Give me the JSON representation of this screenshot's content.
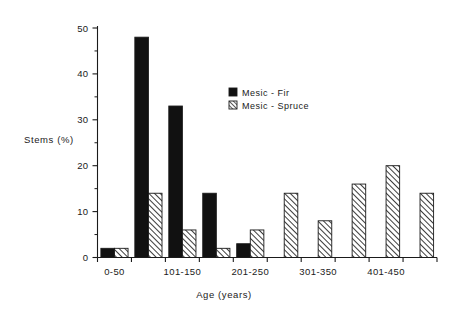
{
  "chart_data": {
    "type": "bar",
    "title": "",
    "xlabel": "Age (years)",
    "ylabel": "Stems (%)",
    "ylim": [
      0,
      50
    ],
    "y_ticks": [
      0,
      10,
      20,
      30,
      40,
      50
    ],
    "y_tick_labels": [
      "0",
      "10",
      "20",
      "30",
      "40",
      "50"
    ],
    "y_minor_ticks": [
      5,
      15,
      25,
      35,
      45
    ],
    "grid": false,
    "legend_position": "upper-center-right",
    "categories": [
      "0-50",
      "51-100",
      "101-150",
      "151-200",
      "201-250",
      "251-300",
      "301-350",
      "351-400",
      "401-450",
      "451-500"
    ],
    "x_tick_labels_shown": [
      "0-50",
      "101-150",
      "201-250",
      "301-350",
      "401-450"
    ],
    "x_label_category_index": [
      0,
      2,
      4,
      6,
      8
    ],
    "series": [
      {
        "name": "Mesic - Fir",
        "fill": "solid-black",
        "color": "#111111",
        "values": [
          2,
          48,
          33,
          14,
          3,
          0,
          0,
          0,
          0,
          0
        ]
      },
      {
        "name": "Mesic - Spruce",
        "fill": "diagonal-hatch",
        "color": "#ffffff",
        "values": [
          2,
          14,
          6,
          2,
          6,
          14,
          8,
          16,
          20,
          14
        ]
      }
    ]
  },
  "legend": {
    "items": [
      {
        "label": "Mesic - Fir",
        "swatch": "solid-black"
      },
      {
        "label": "Mesic - Spruce",
        "swatch": "diagonal-hatch"
      }
    ]
  },
  "colors": {
    "background": "#ffffff",
    "axis": "#1a1a1a",
    "fir": "#111111",
    "spruce_fill": "#ffffff",
    "spruce_hatch": "#1a1a1a"
  }
}
